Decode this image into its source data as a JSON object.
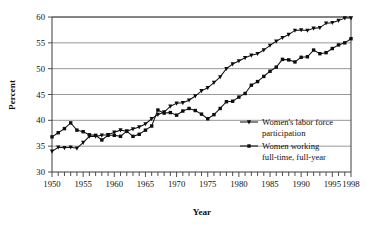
{
  "chart_data": {
    "type": "line",
    "title": "",
    "xlabel": "Year",
    "ylabel": "Percent",
    "xlim": [
      1950,
      1998
    ],
    "ylim": [
      30,
      60
    ],
    "ytick_step": 5,
    "grid": true,
    "grid_axis": "y",
    "legend_position": "inside-right-lower",
    "x": [
      1950,
      1951,
      1952,
      1953,
      1954,
      1955,
      1956,
      1957,
      1958,
      1959,
      1960,
      1961,
      1962,
      1963,
      1964,
      1965,
      1966,
      1967,
      1968,
      1969,
      1970,
      1971,
      1972,
      1973,
      1974,
      1975,
      1976,
      1977,
      1978,
      1979,
      1980,
      1981,
      1982,
      1983,
      1984,
      1985,
      1986,
      1987,
      1988,
      1989,
      1990,
      1991,
      1992,
      1993,
      1994,
      1995,
      1996,
      1997,
      1998
    ],
    "xtick_labels": [
      "1950",
      "1955",
      "1960",
      "1965",
      "1970",
      "1975",
      "1980",
      "1985",
      "1990",
      "1995",
      "1998"
    ],
    "xtick_values": [
      1950,
      1955,
      1960,
      1965,
      1970,
      1975,
      1980,
      1985,
      1990,
      1995,
      1998
    ],
    "ytick_labels": [
      "30",
      "35",
      "40",
      "45",
      "50",
      "55",
      "60"
    ],
    "ytick_values": [
      30,
      35,
      40,
      45,
      50,
      55,
      60
    ],
    "series": [
      {
        "name": "Women's labor force participation",
        "marker": "triangle",
        "values": [
          34.0,
          34.8,
          34.7,
          34.8,
          34.6,
          35.7,
          36.9,
          36.9,
          37.1,
          37.2,
          37.7,
          38.1,
          37.9,
          38.3,
          38.7,
          39.3,
          40.3,
          41.1,
          41.6,
          42.7,
          43.3,
          43.4,
          43.9,
          44.7,
          45.7,
          46.3,
          47.3,
          48.4,
          50.0,
          50.9,
          51.5,
          52.1,
          52.6,
          52.9,
          53.6,
          54.5,
          55.3,
          56.0,
          56.6,
          57.4,
          57.5,
          57.4,
          57.8,
          57.9,
          58.8,
          58.9,
          59.3,
          59.8,
          59.8
        ]
      },
      {
        "name": "Women working full-time, full-year",
        "marker": "square",
        "values": [
          36.8,
          37.6,
          38.4,
          39.5,
          38.1,
          37.8,
          37.2,
          37.1,
          36.2,
          37.1,
          37.1,
          36.9,
          37.9,
          36.9,
          37.3,
          38.1,
          38.9,
          42.0,
          41.4,
          41.5,
          41.0,
          41.8,
          42.3,
          41.9,
          41.2,
          40.3,
          41.1,
          42.3,
          43.6,
          43.7,
          44.5,
          45.2,
          46.8,
          47.5,
          48.5,
          49.5,
          50.3,
          51.8,
          51.7,
          51.3,
          52.2,
          52.3,
          53.6,
          52.9,
          53.1,
          53.9,
          54.6,
          55.0,
          55.8
        ]
      }
    ]
  },
  "legend": {
    "items": [
      {
        "label_line1": "Women's labor force",
        "label_line2": "participation",
        "marker": "triangle"
      },
      {
        "label_line1": "Women working",
        "label_line2": "full-time, full-year",
        "marker": "square"
      }
    ]
  },
  "axes": {
    "x_title": "Year",
    "y_title": "Percent"
  },
  "colors": {
    "line": "#121212",
    "grid": "#8c8c8c",
    "axis": "#3d3d3d",
    "background": "#ffffff"
  }
}
